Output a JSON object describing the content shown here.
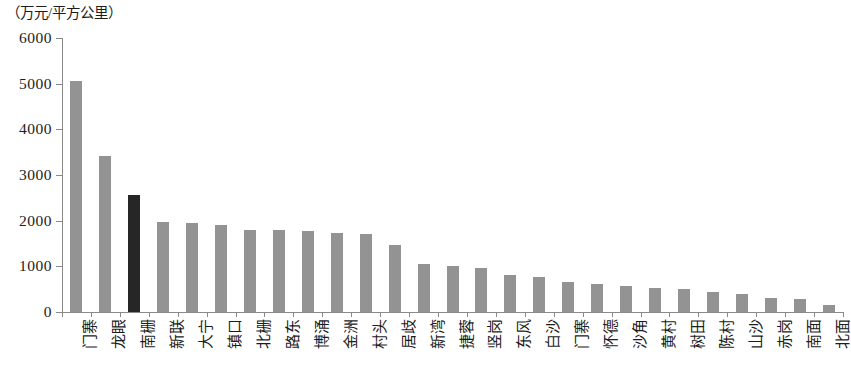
{
  "chart_data": {
    "type": "bar",
    "title": "",
    "subtitle": "",
    "unit_label": "（万元/平方公里）",
    "xlabel": "",
    "ylabel": "",
    "ylim": [
      0,
      6000
    ],
    "ytick_labels": [
      "6000",
      "5000",
      "4000",
      "3000",
      "2000",
      "1000",
      "0"
    ],
    "ytick_values": [
      6000,
      5000,
      4000,
      3000,
      2000,
      1000,
      0
    ],
    "grid": false,
    "legend": null,
    "categories": [
      "门寨",
      "龙眼",
      "南栅",
      "新联",
      "大宁",
      "镇口",
      "北栅",
      "路东",
      "博涌",
      "金洲",
      "村头",
      "居歧",
      "新湾",
      "捷蓉",
      "竖岗",
      "东风",
      "白沙",
      "门寨",
      "怀德",
      "沙角",
      "黄村",
      "树田",
      "陈村",
      "山沙",
      "赤岗",
      "南面",
      "北面"
    ],
    "values": [
      5060,
      3420,
      2560,
      1960,
      1940,
      1900,
      1800,
      1790,
      1770,
      1720,
      1700,
      1470,
      1050,
      1010,
      960,
      820,
      760,
      660,
      620,
      580,
      520,
      500,
      440,
      400,
      300,
      280,
      160
    ],
    "highlight_index": 2,
    "colors": {
      "bar": "#939393",
      "bar_highlight": "#262626",
      "axis": "#8a8a8a",
      "text": "#1c1c1c"
    }
  }
}
